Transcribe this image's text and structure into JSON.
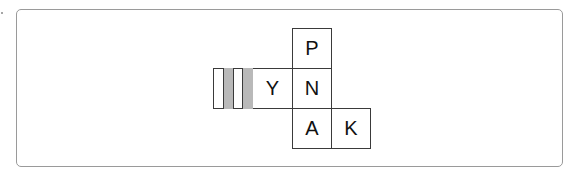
{
  "diagram": {
    "faces": [
      {
        "id": "p",
        "label": "P",
        "x": 292,
        "y": 28,
        "w": 40,
        "h": 41
      },
      {
        "id": "y",
        "label": "Y",
        "x": 253,
        "y": 68,
        "w": 40,
        "h": 41
      },
      {
        "id": "n",
        "label": "N",
        "x": 292,
        "y": 68,
        "w": 40,
        "h": 41
      },
      {
        "id": "a",
        "label": "A",
        "x": 292,
        "y": 108,
        "w": 40,
        "h": 41
      },
      {
        "id": "k",
        "label": "K",
        "x": 331,
        "y": 108,
        "w": 40,
        "h": 41
      }
    ],
    "striped_face": {
      "x": 213,
      "y": 68,
      "w": 41,
      "h": 41,
      "stripe_color": "#b9b9b9"
    },
    "colors": {
      "border": "#3a3a3a",
      "frame": "#9a9a9a",
      "stripe": "#b9b9b9"
    }
  }
}
